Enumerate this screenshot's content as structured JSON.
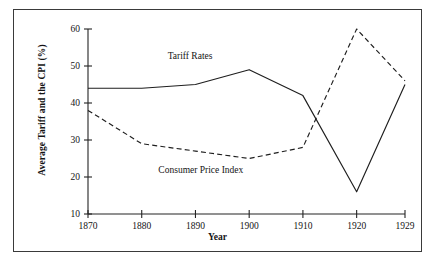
{
  "chart_data": {
    "type": "line",
    "title": "",
    "xlabel": "Year",
    "ylabel": "Average Tariff and the CPI (%)",
    "x": [
      1870,
      1880,
      1890,
      1900,
      1910,
      1920,
      1929
    ],
    "xticklabels": [
      "1870",
      "1880",
      "1890",
      "1900",
      "1910",
      "1920",
      "1929"
    ],
    "yticklabels": [
      "10",
      "20",
      "30",
      "40",
      "50",
      "60"
    ],
    "yticks": [
      10,
      20,
      30,
      40,
      50,
      60
    ],
    "ylim": [
      10,
      60
    ],
    "xlim": [
      1870,
      1929
    ],
    "grid": false,
    "legend": "inline-annotations",
    "series": [
      {
        "name": "Tariff Rates",
        "style": "solid",
        "values": [
          44,
          44,
          45,
          49,
          42,
          16,
          45
        ]
      },
      {
        "name": "Consumer Price Index",
        "style": "dashed",
        "values": [
          38,
          29,
          27,
          25,
          28,
          60,
          46
        ]
      }
    ],
    "annotations": [
      {
        "text": "Tariff Rates",
        "x": 1889,
        "y": 52
      },
      {
        "text": "Consumer Price Index",
        "x": 1891,
        "y": 21
      }
    ],
    "colors": {
      "line": "#1e1e1e",
      "axis": "#242424",
      "frame": "#3a3a3a",
      "background": "#ffffff"
    }
  }
}
